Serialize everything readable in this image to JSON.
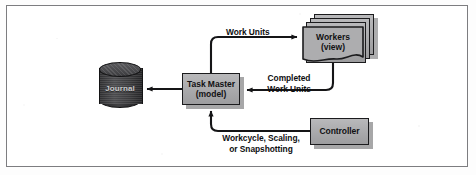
{
  "figure": {
    "kind": "architecture-diagram",
    "border_color": "#7d7d80",
    "background_color": "#ffffff"
  },
  "nodes": {
    "journal": {
      "label": "Journal",
      "shape": "cylinder",
      "fill": "#3a3a3c",
      "text_color": "#c9c9cb"
    },
    "task_master": {
      "line1": "Task Master",
      "line2": "(model)",
      "shape": "rectangle",
      "fill": "#ababad",
      "border": "#1b1b1d"
    },
    "workers": {
      "line1": "Workers",
      "line2": "(view)",
      "shape": "stacked-document",
      "stack_count": 3,
      "fill": "#ababad",
      "border": "#1b1b1d"
    },
    "controller": {
      "label": "Controller",
      "shape": "rectangle",
      "fill": "#ababad",
      "border": "#1b1b1d"
    }
  },
  "edges": {
    "task_master_to_workers": {
      "label": "Work Units",
      "from": "task_master",
      "to": "workers"
    },
    "workers_to_task_master": {
      "label_line1": "Completed",
      "label_line2": "Work Units",
      "from": "workers",
      "to": "task_master"
    },
    "task_master_to_journal": {
      "label": "",
      "from": "task_master",
      "to": "journal"
    },
    "controller_to_task_master": {
      "label_line1": "Workcycle, Scaling,",
      "label_line2": "or Snapshotting",
      "from": "controller",
      "to": "task_master"
    }
  }
}
